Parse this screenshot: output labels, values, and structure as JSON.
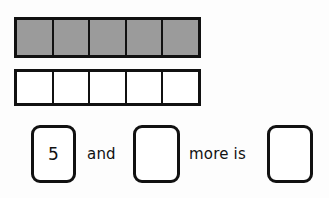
{
  "worksheet": {
    "type": "math-counting-worksheet",
    "colors": {
      "background": "#fdfdfd",
      "ink": "#111111",
      "filled_cell": "#9b9b9b",
      "empty_cell": "#ffffff"
    },
    "strips": [
      {
        "name": "filled-strip",
        "cell_count": 5,
        "filled_count": 5,
        "cells": [
          "filled",
          "filled",
          "filled",
          "filled",
          "filled"
        ]
      },
      {
        "name": "empty-strip",
        "cell_count": 5,
        "filled_count": 0,
        "cells": [
          "empty",
          "empty",
          "empty",
          "empty",
          "empty"
        ]
      }
    ],
    "sentence": {
      "first_value": "5",
      "connector_and": "and",
      "second_value": "",
      "connector_more_is": "more is",
      "result_value": ""
    }
  }
}
